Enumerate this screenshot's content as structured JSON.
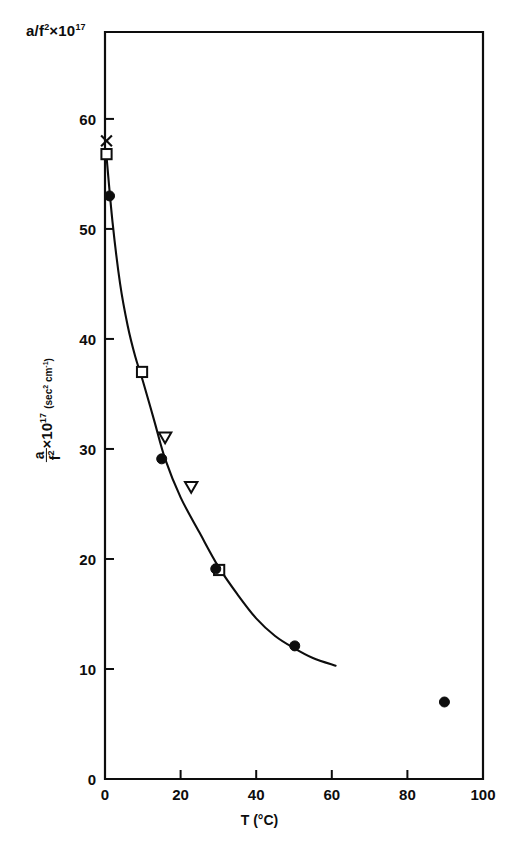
{
  "figure": {
    "header_label": "a/f²×10¹⁷",
    "header_base": "a/f",
    "header_exp": "2",
    "header_mult": "×10",
    "header_power": "17",
    "background_color": "#ffffff",
    "ink_color": "#0d0d0d"
  },
  "chart_data": {
    "type": "scatter",
    "title": "",
    "subtitle": "",
    "xlabel": "T (°C)",
    "ylabel": "a/f² ×10¹⁷ (sec² cm⁻¹)",
    "ylabel_parts": {
      "numerator": "a",
      "denominator": "f",
      "denominator_exp": "2",
      "multiplier": "×10",
      "power": "17",
      "units_open": "(",
      "units_sec": "sec",
      "units_sec_exp": "2",
      "units_cm": "cm",
      "units_cm_exp": "-1",
      "units_close": ")"
    },
    "xlim": [
      0,
      100
    ],
    "ylim": [
      0,
      67.9
    ],
    "xticks": [
      0,
      20,
      40,
      60,
      80,
      100
    ],
    "xtick_labels": [
      "0",
      "20",
      "40",
      "60",
      "80",
      "100"
    ],
    "yticks": [
      10,
      20,
      30,
      40,
      50,
      60
    ],
    "ytick_labels": [
      "10",
      "20",
      "30",
      "40",
      "50",
      "60"
    ],
    "grid": false,
    "legend": null,
    "series": [
      {
        "name": "cross-marker",
        "marker": "x",
        "fill": "none",
        "points": [
          {
            "x": 0.4,
            "y": 58.0
          }
        ]
      },
      {
        "name": "open-square",
        "marker": "square-open",
        "fill": "none",
        "points": [
          {
            "x": 0.4,
            "y": 56.8
          },
          {
            "x": 9.8,
            "y": 37.0
          },
          {
            "x": 30.2,
            "y": 19.0
          }
        ]
      },
      {
        "name": "filled-circle",
        "marker": "circle-filled",
        "fill": "#0d0d0d",
        "points": [
          {
            "x": 1.2,
            "y": 53.0
          },
          {
            "x": 15.0,
            "y": 29.1
          },
          {
            "x": 29.3,
            "y": 19.1
          },
          {
            "x": 50.2,
            "y": 12.1
          },
          {
            "x": 89.8,
            "y": 7.0
          }
        ]
      },
      {
        "name": "open-triangle-down",
        "marker": "triangle-down-open",
        "fill": "none",
        "points": [
          {
            "x": 15.9,
            "y": 31.0
          },
          {
            "x": 22.8,
            "y": 26.5
          }
        ]
      }
    ],
    "fit_curve": {
      "name": "smooth-fit",
      "style": "solid",
      "x_start": 0.3,
      "x_end": 61.0,
      "points": [
        {
          "x": 0.3,
          "y": 57.0
        },
        {
          "x": 2.0,
          "y": 50.6
        },
        {
          "x": 4.0,
          "y": 45.0
        },
        {
          "x": 6.0,
          "y": 41.2
        },
        {
          "x": 8.0,
          "y": 38.4
        },
        {
          "x": 10.0,
          "y": 36.2
        },
        {
          "x": 13.0,
          "y": 32.6
        },
        {
          "x": 16.0,
          "y": 29.0
        },
        {
          "x": 20.0,
          "y": 25.6
        },
        {
          "x": 25.0,
          "y": 22.4
        },
        {
          "x": 30.0,
          "y": 19.3
        },
        {
          "x": 35.0,
          "y": 16.8
        },
        {
          "x": 40.0,
          "y": 14.6
        },
        {
          "x": 45.0,
          "y": 13.0
        },
        {
          "x": 50.0,
          "y": 11.9
        },
        {
          "x": 55.0,
          "y": 11.0
        },
        {
          "x": 61.0,
          "y": 10.3
        }
      ]
    }
  }
}
